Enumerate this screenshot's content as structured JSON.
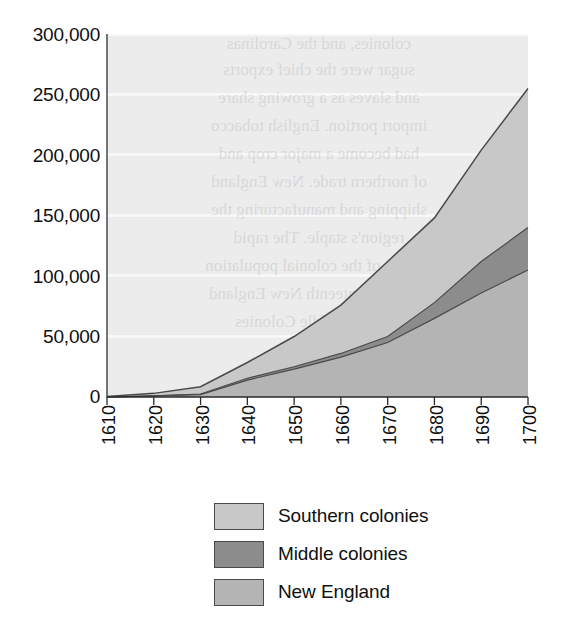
{
  "chart_data": {
    "type": "area",
    "stacked": true,
    "title": "",
    "subtitle": "",
    "xlabel": "",
    "ylabel": "",
    "x": [
      1610,
      1620,
      1630,
      1640,
      1650,
      1660,
      1670,
      1680,
      1690,
      1700
    ],
    "xtick_labels": [
      "1610",
      "1620",
      "1630",
      "1640",
      "1650",
      "1660",
      "1670",
      "1680",
      "1690",
      "1700"
    ],
    "ytick_labels": [
      "0",
      "50,000",
      "100,000",
      "150,000",
      "200,000",
      "250,000",
      "300,000"
    ],
    "ytick_values": [
      0,
      50000,
      100000,
      150000,
      200000,
      250000,
      300000
    ],
    "ylim": [
      0,
      300000
    ],
    "xlim": [
      1610,
      1700
    ],
    "grid": true,
    "grid_orientation": "horizontal",
    "legend_position": "bottom",
    "stack_order_bottom_to_top": [
      "New England",
      "Middle colonies",
      "Southern colonies"
    ],
    "series": [
      {
        "name": "New England",
        "color": "#b4b4b4",
        "values": [
          0,
          1000,
          2000,
          14000,
          23000,
          33000,
          45000,
          65000,
          86000,
          105000
        ]
      },
      {
        "name": "Middle colonies",
        "color": "#8c8c8c",
        "values": [
          0,
          0,
          500,
          1500,
          2000,
          3000,
          5000,
          13000,
          26000,
          35000
        ]
      },
      {
        "name": "Southern colonies",
        "color": "#c8c8c8",
        "values": [
          500,
          2000,
          6000,
          13000,
          25000,
          40000,
          62000,
          70000,
          92000,
          115000
        ]
      }
    ],
    "cumulative_totals": [
      500,
      3000,
      8500,
      28500,
      50000,
      76000,
      112000,
      148000,
      204000,
      255000
    ]
  },
  "legend": {
    "items": [
      {
        "label": "Southern colonies",
        "color": "#c8c8c8"
      },
      {
        "label": "Middle colonies",
        "color": "#8c8c8c"
      },
      {
        "label": "New England",
        "color": "#b4b4b4"
      }
    ]
  },
  "ghost_text": {
    "lines": [
      "colonies, and the Carolinas",
      "sugar were the chief exports",
      "and slaves as a growing share",
      "import portion. English tobacco",
      "had become a major crop and",
      "of northern trade. New England",
      "shipping and manufacturing the",
      "region's staple. The rapid",
      "growth of the colonial population",
      "in the seventeenth New England",
      "and the Middle Colonies"
    ]
  }
}
